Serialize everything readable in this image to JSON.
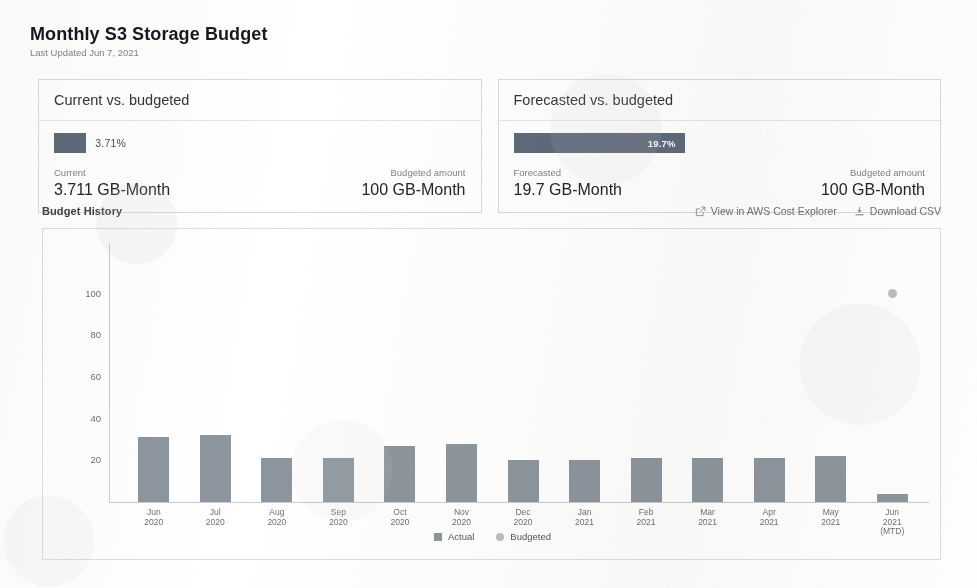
{
  "header": {
    "title": "Monthly S3 Storage Budget",
    "last_updated": "Last Updated Jun 7, 2021"
  },
  "cards": [
    {
      "title": "Current vs. budgeted",
      "percent_label": "3.71%",
      "percent_value": 3.71,
      "label_inside": false,
      "left_label": "Current",
      "left_value": "3.711 GB-Month",
      "right_label": "Budgeted amount",
      "right_value": "100 GB-Month"
    },
    {
      "title": "Forecasted vs. budgeted",
      "percent_label": "19.7%",
      "percent_value": 19.7,
      "label_inside": true,
      "left_label": "Forecasted",
      "left_value": "19.7 GB-Month",
      "right_label": "Budgeted amount",
      "right_value": "100 GB-Month"
    }
  ],
  "budget_history": {
    "title": "Budget History",
    "links": [
      {
        "label": "View in AWS Cost Explorer",
        "icon": "external-link-icon"
      },
      {
        "label": "Download CSV",
        "icon": "download-icon"
      }
    ]
  },
  "colors": {
    "bar": "#8d959e",
    "dot": "#b9bfc6",
    "progress": "#5f6b7a",
    "text": "#2a2f35",
    "muted": "#7d848c",
    "border": "#d8dbdf"
  },
  "chart_data": {
    "type": "bar",
    "title": "Budget History",
    "xlabel": "",
    "ylabel": "",
    "ylim": [
      0,
      110
    ],
    "yticks": [
      20,
      40,
      60,
      80,
      100
    ],
    "grid": false,
    "legend": [
      "Actual",
      "Budgeted"
    ],
    "legend_position": "bottom",
    "categories": [
      "Jun\n2020",
      "Jul\n2020",
      "Aug\n2020",
      "Sep\n2020",
      "Oct\n2020",
      "Nov\n2020",
      "Dec\n2020",
      "Jan\n2021",
      "Feb\n2021",
      "Mar\n2021",
      "Apr\n2021",
      "May\n2021",
      "Jun\n2021\n(MTD)"
    ],
    "series": [
      {
        "name": "Actual",
        "type": "bar",
        "values": [
          31,
          32,
          21,
          21,
          27,
          28,
          20,
          20,
          21,
          21,
          21,
          22,
          3.7
        ]
      },
      {
        "name": "Budgeted",
        "type": "scatter",
        "values": [
          null,
          null,
          null,
          null,
          null,
          null,
          null,
          null,
          null,
          null,
          null,
          null,
          100
        ]
      }
    ],
    "units": "GB-Month"
  },
  "xlabels": [
    {
      "l1": "Jun",
      "l2": "2020",
      "l3": ""
    },
    {
      "l1": "Jul",
      "l2": "2020",
      "l3": ""
    },
    {
      "l1": "Aug",
      "l2": "2020",
      "l3": ""
    },
    {
      "l1": "Sep",
      "l2": "2020",
      "l3": ""
    },
    {
      "l1": "Oct",
      "l2": "2020",
      "l3": ""
    },
    {
      "l1": "Nov",
      "l2": "2020",
      "l3": ""
    },
    {
      "l1": "Dec",
      "l2": "2020",
      "l3": ""
    },
    {
      "l1": "Jan",
      "l2": "2021",
      "l3": ""
    },
    {
      "l1": "Feb",
      "l2": "2021",
      "l3": ""
    },
    {
      "l1": "Mar",
      "l2": "2021",
      "l3": ""
    },
    {
      "l1": "Apr",
      "l2": "2021",
      "l3": ""
    },
    {
      "l1": "May",
      "l2": "2021",
      "l3": ""
    },
    {
      "l1": "Jun",
      "l2": "2021",
      "l3": "(MTD)"
    }
  ],
  "yticks": [
    "100",
    "80",
    "60",
    "40",
    "20"
  ],
  "legend": [
    {
      "label": "Actual",
      "swatch": "square"
    },
    {
      "label": "Budgeted",
      "swatch": "circle"
    }
  ]
}
